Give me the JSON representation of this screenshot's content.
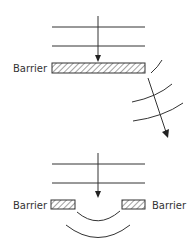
{
  "diagram": {
    "top": {
      "barrier_label": "Barrier",
      "description": "Plane waves hitting a wide barrier; waves bend around the edge"
    },
    "bottom": {
      "left_barrier_label": "Barrier",
      "right_barrier_label": "Barrier",
      "description": "Plane waves passing through a gap between two barriers; diffracted circular wavefronts"
    },
    "colors": {
      "line": "#333333",
      "background": "#ffffff"
    }
  }
}
